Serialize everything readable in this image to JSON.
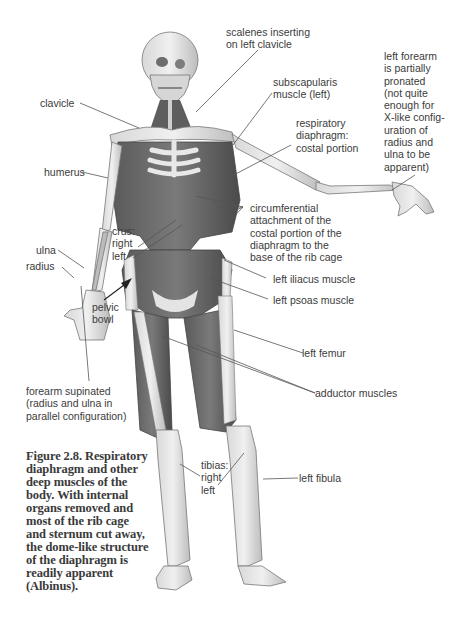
{
  "figure": {
    "caption": "Figure 2.8. Respiratory diaphragm and other deep muscles of the body. With internal organs removed and most of the rib cage and sternum cut away, the dome-like structure of the diaphragm is readily apparent (Albinus).",
    "labels": {
      "scalenes": "scalenes inserting\non left clavicle",
      "left_forearm": "left forearm\nis partially\npronated\n(not quite\nenough for\nX-like config-\nuration of\nradius and\nulna to be\napparent)",
      "clavicle": "clavicle",
      "subscapularis": "subscapularis\nmuscle (left)",
      "diaphragm_costal": "respiratory\ndiaphragm:\ncostal portion",
      "humerus": "humerus",
      "circumferential": "circumferential\nattachment of the\ncostal portion of the\ndiaphragm to the\nbase of the rib cage",
      "crus": "crus:\nright\nleft",
      "ulna": "ulna",
      "radius": "radius",
      "left_iliacus": "left iliacus muscle",
      "left_psoas": "left psoas muscle",
      "pelvic_bowl": "pelvic\nbowl",
      "left_femur": "left femur",
      "forearm_supinated": "forearm supinated\n(radius and ulna in\nparallel configuration)",
      "adductor": "adductor muscles",
      "tibias": "tibias:\nright\nleft",
      "left_fibula": "left fibula"
    },
    "colors": {
      "bone": "#e6e6e6",
      "bone_outline": "#6e6e6e",
      "muscle": "#6a6a6a",
      "muscle_dark": "#4c4c4c",
      "leader_line": "#555555",
      "text": "#3b3b3b"
    }
  }
}
